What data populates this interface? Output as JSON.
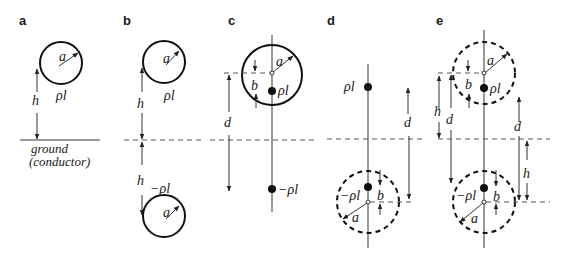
{
  "figure": {
    "panels": [
      {
        "id": "a",
        "label": "a",
        "symbols": {
          "radius": "a",
          "charge": "ρl",
          "height": "h"
        },
        "ground_text_1": "ground",
        "ground_text_2": "(conductor)"
      },
      {
        "id": "b",
        "label": "b",
        "symbols": {
          "radius_top": "a",
          "charge_top": "ρl",
          "height_top": "h",
          "height_bottom": "h",
          "charge_bottom": "−ρl",
          "radius_bottom": "a"
        }
      },
      {
        "id": "c",
        "label": "c",
        "symbols": {
          "radius": "a",
          "offset": "b",
          "charge": "ρl",
          "distance": "d",
          "image_charge": "−ρl"
        }
      },
      {
        "id": "d",
        "label": "d",
        "symbols": {
          "charge": "ρl",
          "distance": "d",
          "image_charge": "−ρl",
          "offset": "b",
          "radius": "a"
        }
      },
      {
        "id": "e",
        "label": "e",
        "symbols": {
          "radius_top": "a",
          "offset_top": "b",
          "charge_top": "ρl",
          "height_left": "h",
          "distance_left": "d",
          "distance_right": "d",
          "height_right": "h",
          "charge_bottom": "−ρl",
          "offset_bottom": "b",
          "radius_bottom": "a"
        }
      }
    ]
  }
}
